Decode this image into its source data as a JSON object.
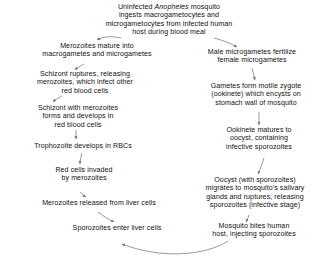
{
  "diagram": {
    "stroke_color": "#777777",
    "text_color": "#111111",
    "background": "#ffffff",
    "flow_direction": "counterclockwise oval cycle",
    "nodes": [
      {
        "id": "uninfected-mosquito",
        "line1": "Uninfected ",
        "scientific_name": "Anopheles",
        "line2": " mosquito\ningests macrogametocytes and\nmicrogametocytes from infected human\nhost during blood meal"
      },
      {
        "id": "merozoites-mature",
        "text": "Merozoites mature into\nmacrogametes and microgametes"
      },
      {
        "id": "male-microgametes-fertilize",
        "text": "Male microgametes fertilize\nfemale microgametes"
      },
      {
        "id": "schizont-ruptures",
        "text": "Schizont ruptures, releasing\nmerozoites, which infect other\nred blood cells"
      },
      {
        "id": "gametes-form-zygote",
        "text": "Gametes form motile zygote\n(ookinete) which encysts on\nstomach wall of mosquito"
      },
      {
        "id": "schizont-forms",
        "text": "Schizont with merozoites\nforms and develops in\nred blood cells"
      },
      {
        "id": "ookinete-matures",
        "text": "Ookinete matures to\noocyst, containing\ninfective sporozoites"
      },
      {
        "id": "trophozoite",
        "text": "Trophozoite develops in RBCs"
      },
      {
        "id": "red-cells-invaded",
        "text": "Red cells invaded\nby merozoites"
      },
      {
        "id": "oocyst-migrates",
        "text": "Oocyst (with sporozoites)\nmigrates to mosquito's salivary\nglands and ruptures, releasing\nsporozoites (infective stage)"
      },
      {
        "id": "merozoites-released-liver",
        "text": "Merozoites released from liver cells"
      },
      {
        "id": "sporozoites-enter-liver",
        "text": "Sporozoites enter liver cells"
      },
      {
        "id": "mosquito-bites-human",
        "text": "Mosquito bites human\nhost, injecting sporozoites"
      }
    ]
  }
}
